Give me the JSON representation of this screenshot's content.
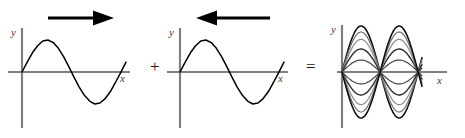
{
  "figure": {
    "background_color": "#ffffff",
    "axis_color": "#808080",
    "curve_color": "#000000",
    "operators": {
      "plus": "+",
      "equals": "="
    }
  },
  "panels": [
    {
      "id": "wave-right",
      "caption": "Sine wave travelling to the right",
      "direction_arrow": "arrow-right",
      "axis": {
        "y_label": "y",
        "x_label": "x"
      },
      "chart_data": {
        "type": "line",
        "title": "",
        "xlabel": "x",
        "ylabel": "y",
        "grid": false,
        "legend": "none",
        "xlim": [
          0,
          6.6
        ],
        "ylim": [
          -1.25,
          1.25
        ],
        "series": [
          {
            "name": "rightward travelling wave",
            "form": "y = sin(x)",
            "amplitude": 1,
            "cycles": 1,
            "phase": 0,
            "color": "#000000",
            "x": [
              0,
              0.33,
              0.66,
              0.99,
              1.32,
              1.65,
              1.98,
              2.31,
              2.64,
              2.97,
              3.3,
              3.63,
              3.96,
              4.29,
              4.62,
              4.95,
              5.28,
              5.61,
              5.94,
              6.27,
              6.6
            ],
            "values": [
              0,
              0.31,
              0.6,
              0.82,
              0.97,
              1.0,
              0.92,
              0.74,
              0.48,
              0.17,
              -0.16,
              -0.47,
              -0.73,
              -0.91,
              -1.0,
              -0.97,
              -0.83,
              -0.61,
              -0.32,
              -0.01,
              0.31
            ]
          }
        ]
      }
    },
    {
      "id": "wave-left",
      "caption": "Sine wave travelling to the left",
      "direction_arrow": "arrow-left",
      "axis": {
        "y_label": "y",
        "x_label": "x"
      },
      "chart_data": {
        "type": "line",
        "title": "",
        "xlabel": "x",
        "ylabel": "y",
        "grid": false,
        "legend": "none",
        "xlim": [
          0,
          6.6
        ],
        "ylim": [
          -1.25,
          1.25
        ],
        "series": [
          {
            "name": "leftward travelling wave",
            "form": "y = sin(x)",
            "amplitude": 1,
            "cycles": 1,
            "phase": 0,
            "color": "#000000",
            "x": [
              0,
              0.33,
              0.66,
              0.99,
              1.32,
              1.65,
              1.98,
              2.31,
              2.64,
              2.97,
              3.3,
              3.63,
              3.96,
              4.29,
              4.62,
              4.95,
              5.28,
              5.61,
              5.94,
              6.27,
              6.6
            ],
            "values": [
              0,
              0.31,
              0.6,
              0.82,
              0.97,
              1.0,
              0.92,
              0.74,
              0.48,
              0.17,
              -0.16,
              -0.47,
              -0.73,
              -0.91,
              -1.0,
              -0.97,
              -0.83,
              -0.61,
              -0.32,
              -0.01,
              0.31
            ]
          }
        ]
      }
    },
    {
      "id": "standing-wave",
      "caption": "Resulting standing wave shown at successive instants",
      "direction_arrow": "none",
      "axis": {
        "y_label": "y",
        "x_label": "x"
      },
      "chart_data": {
        "type": "line",
        "title": "",
        "xlabel": "x",
        "ylabel": "y",
        "grid": false,
        "legend": "none",
        "xlim": [
          0,
          6.6
        ],
        "ylim": [
          -2.1,
          2.1
        ],
        "nodes_x": [
          0,
          3.142,
          6.283
        ],
        "antinodes_x": [
          1.571,
          4.712
        ],
        "envelope_amplitude": 2,
        "snapshots": 13,
        "series": [
          {
            "name": "t0",
            "amplitude_factor": 1.0,
            "color": "#111111",
            "width": 1.6
          },
          {
            "name": "t1",
            "amplitude_factor": 0.87,
            "color": "#6e6e6e",
            "width": 1.2
          },
          {
            "name": "t2",
            "amplitude_factor": 0.71,
            "color": "#8c8c8c",
            "width": 1.2
          },
          {
            "name": "t3",
            "amplitude_factor": 0.5,
            "color": "#2b2b2b",
            "width": 1.4
          },
          {
            "name": "t4",
            "amplitude_factor": 0.26,
            "color": "#444444",
            "width": 1.2
          },
          {
            "name": "t5",
            "amplitude_factor": 0.0,
            "color": "#808080",
            "width": 1.2
          },
          {
            "name": "t6",
            "amplitude_factor": -0.26,
            "color": "#444444",
            "width": 1.2
          },
          {
            "name": "t7",
            "amplitude_factor": -0.5,
            "color": "#2b2b2b",
            "width": 1.4
          },
          {
            "name": "t8",
            "amplitude_factor": -0.71,
            "color": "#8c8c8c",
            "width": 1.2
          },
          {
            "name": "t9",
            "amplitude_factor": -0.87,
            "color": "#6e6e6e",
            "width": 1.2
          },
          {
            "name": "t10",
            "amplitude_factor": -1.0,
            "color": "#111111",
            "width": 1.6
          }
        ]
      }
    }
  ]
}
